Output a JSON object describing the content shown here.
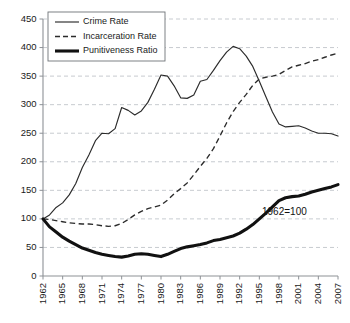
{
  "chart_data": {
    "type": "line",
    "title": "",
    "xlabel": "",
    "ylabel": "",
    "ylim": [
      0,
      450
    ],
    "xlim": [
      1962,
      2007
    ],
    "grid": true,
    "legend_position": "upper-left-inside",
    "annotation": "1962=100",
    "ytick_labels": [
      "0",
      "50",
      "100",
      "150",
      "200",
      "250",
      "300",
      "350",
      "400",
      "450"
    ],
    "ytick_values": [
      0,
      50,
      100,
      150,
      200,
      250,
      300,
      350,
      400,
      450
    ],
    "xtick_labels": [
      "1962",
      "1965",
      "1968",
      "1971",
      "1974",
      "1977",
      "1980",
      "1983",
      "1986",
      "1989",
      "1992",
      "1995",
      "1998",
      "2001",
      "2004",
      "2007"
    ],
    "xtick_values": [
      1962,
      1965,
      1968,
      1971,
      1974,
      1977,
      1980,
      1983,
      1986,
      1989,
      1992,
      1995,
      1998,
      2001,
      2004,
      2007
    ],
    "x": [
      1962,
      1963,
      1964,
      1965,
      1966,
      1967,
      1968,
      1969,
      1970,
      1971,
      1972,
      1973,
      1974,
      1975,
      1976,
      1977,
      1978,
      1979,
      1980,
      1981,
      1982,
      1983,
      1984,
      1985,
      1986,
      1987,
      1988,
      1989,
      1990,
      1991,
      1992,
      1993,
      1994,
      1995,
      1996,
      1997,
      1998,
      1999,
      2000,
      2001,
      2002,
      2003,
      2004,
      2005,
      2006,
      2007
    ],
    "series": [
      {
        "name": "Crime Rate",
        "style": "thin-solid",
        "values": [
          100,
          107,
          120,
          128,
          142,
          162,
          190,
          212,
          237,
          250,
          249,
          258,
          295,
          290,
          282,
          289,
          304,
          327,
          352,
          350,
          333,
          312,
          311,
          317,
          341,
          344,
          360,
          377,
          392,
          402,
          398,
          385,
          367,
          341,
          314,
          287,
          266,
          261,
          262,
          263,
          259,
          254,
          250,
          250,
          249,
          245
        ]
      },
      {
        "name": "Incarceration Rate",
        "style": "dashed",
        "values": [
          100,
          99,
          97,
          95,
          93,
          92,
          91,
          91,
          90,
          88,
          87,
          88,
          92,
          99,
          107,
          113,
          118,
          121,
          124,
          133,
          144,
          153,
          163,
          177,
          192,
          206,
          223,
          245,
          268,
          288,
          304,
          318,
          334,
          345,
          348,
          350,
          353,
          360,
          366,
          369,
          372,
          376,
          379,
          383,
          387,
          390
        ]
      },
      {
        "name": "Punitiveness Ratio",
        "style": "thick-solid",
        "values": [
          100,
          86,
          77,
          68,
          61,
          55,
          49,
          45,
          41,
          38,
          36,
          34,
          33,
          35,
          38,
          39,
          38,
          36,
          34,
          38,
          43,
          48,
          51,
          53,
          55,
          58,
          62,
          64,
          67,
          70,
          75,
          82,
          90,
          100,
          110,
          121,
          132,
          137,
          139,
          140,
          143,
          147,
          150,
          153,
          156,
          160
        ]
      }
    ]
  },
  "legend": {
    "items": [
      {
        "label": "Crime Rate"
      },
      {
        "label": "Incarceration Rate"
      },
      {
        "label": "Punitiveness Ratio"
      }
    ]
  }
}
